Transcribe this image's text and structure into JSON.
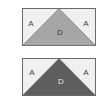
{
  "figures": [
    {
      "id": "top",
      "labels": {
        "left": "A",
        "right": "A",
        "center": "D"
      },
      "colors": {
        "background": "#f0f0f0",
        "triangle": "#a6a6a6",
        "border": "#6a6a6a",
        "corner_text": "#444444",
        "center_text": "#333333"
      }
    },
    {
      "id": "bottom",
      "labels": {
        "left": "A",
        "right": "A",
        "center": "D"
      },
      "colors": {
        "background": "#f0f0f0",
        "triangle": "#5e5e5e",
        "border": "#6a6a6a",
        "corner_text": "#444444",
        "center_text": "#e6e6e6"
      }
    }
  ]
}
